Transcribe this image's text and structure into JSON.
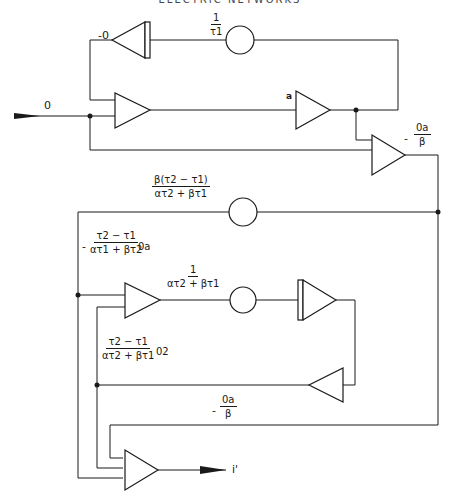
{
  "header": {
    "text": "ELECTRIC NETWORKS"
  },
  "input": {
    "label": "0"
  },
  "output": {
    "label": "i'"
  },
  "top_loop": {
    "integrator_output_label": "-0",
    "coefficient": {
      "num": "1",
      "den": "τ1"
    }
  },
  "forward_path": {
    "amplifier_label": "a",
    "summer_output": {
      "sign": "-",
      "num": "0a",
      "den": "β"
    }
  },
  "middle_branch": {
    "coefficient": {
      "num": "β(τ2 − τ1)",
      "den": "ατ2 + βτ1"
    },
    "signal": {
      "sign": "-",
      "num": "τ2 − τ1",
      "den": "ατ1 + βτ2",
      "suffix": "0a"
    }
  },
  "lower_loop": {
    "coefficient": {
      "num": "1",
      "den": "ατ2 + βτ1"
    },
    "signal": {
      "num": "τ2 − τ1",
      "den": "ατ2 + βτ1",
      "suffix": "02"
    },
    "feedback": {
      "sign": "-",
      "num": "0a",
      "den": "β"
    }
  },
  "colors": {
    "line": "#1a1a1a",
    "background": "#ffffff"
  }
}
